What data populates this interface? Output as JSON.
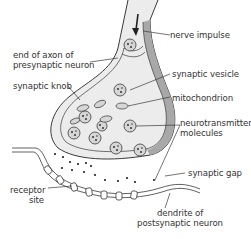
{
  "diagram": {
    "labels": {
      "nerve_impulse": "nerve impulse",
      "axon_end_line1": "end of axon of",
      "axon_end_line2": "presynaptic neuron",
      "synaptic_knob": "synaptic knob",
      "synaptic_vesicle": "synaptic vesicle",
      "mitochondrion": "mitochondrion",
      "neurotransmitter_line1": "neurotransmitter",
      "neurotransmitter_line2": "molecules",
      "synaptic_gap": "synaptic gap",
      "receptor_line1": "receptor",
      "receptor_line2": "site",
      "dendrite_line1": "dendrite of",
      "dendrite_line2": "postsynaptic neuron"
    },
    "colors": {
      "outline": "#3a3a3a",
      "cytoplasm": "#ececec",
      "membrane_shade": "#a8a8a8",
      "vesicle_fill": "#d6d6d6",
      "text": "#333333"
    }
  }
}
